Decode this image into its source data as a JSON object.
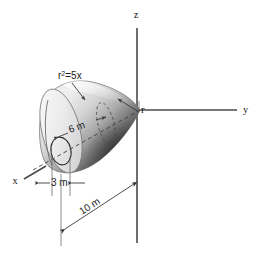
{
  "figure": {
    "background_color": "#ffffff",
    "ink_color": "#1a1a1a"
  },
  "axes": [
    {
      "name": "z-axis",
      "label": "z",
      "direction": "up",
      "label_x": 136,
      "label_y": 18
    },
    {
      "name": "y-axis",
      "label": "y",
      "direction": "right",
      "label_x": 243,
      "label_y": 113
    },
    {
      "name": "x-axis",
      "label": "x",
      "direction": "lower-left",
      "label_x": 15,
      "label_y": 184
    }
  ],
  "annotations": [
    {
      "name": "curve-equation",
      "base": "r",
      "superscript": "2",
      "rest": "=5x",
      "full_text": "r²=5x",
      "x": 60,
      "y": 78,
      "leader": "arrow pointing down-right to the upper surface of the solid"
    },
    {
      "name": "radius-callout",
      "text": "r",
      "x": 140,
      "y": 115,
      "leader": "arrow pointing down-left from the r label to the axis of revolution"
    }
  ],
  "dimensions": [
    {
      "name": "dim-6m",
      "text": "6 m",
      "value": 6,
      "unit": "m",
      "x": 75,
      "y": 131,
      "rotation": -20,
      "arrows": "both ends, inward",
      "measures": "distance from left end face to the interior dashed circle"
    },
    {
      "name": "dim-3m",
      "text": "3 m",
      "value": 3,
      "unit": "m",
      "x": 57,
      "y": 183,
      "rotation": 0,
      "arrows": "both ends, inward",
      "measures": "width of the small circular hole at the left end face"
    },
    {
      "name": "dim-10m",
      "text": "10 m",
      "value": 10,
      "unit": "m",
      "x": 88,
      "y": 212,
      "rotation": -20,
      "arrows": "both ends, outward",
      "measures": "overall length of the solid along the x-axis from the left end face to the origin"
    }
  ],
  "solid": {
    "name": "paraboloid-solid",
    "shape": "paraboloid of revolution",
    "shading": "light gray on upper-left, dark gray on lower-right",
    "light_color": "#e9e9e9",
    "mid_color": "#b8b8b8",
    "dark_color": "#2e2e2e",
    "features": [
      "left flat circular end face",
      "small circular hole on left end face",
      "dashed interior circle marking the 6 m station",
      "dashed centerline along the axis of revolution"
    ]
  }
}
